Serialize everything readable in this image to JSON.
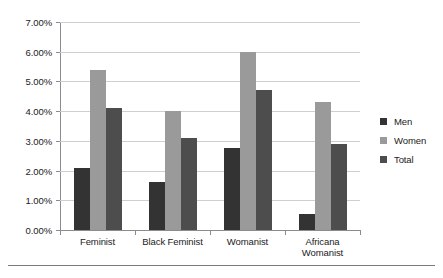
{
  "chart_data": {
    "type": "bar",
    "title": "",
    "xlabel": "",
    "ylabel": "",
    "categories": [
      "Feminist",
      "Black Feminist",
      "Womanist",
      "Africana Womanist"
    ],
    "category_lines": [
      [
        "Feminist"
      ],
      [
        "Black Feminist"
      ],
      [
        "Womanist"
      ],
      [
        "Africana",
        "Womanist"
      ]
    ],
    "series": [
      {
        "name": "Men",
        "color": "#333333",
        "values": [
          2.1,
          1.6,
          2.75,
          0.55
        ]
      },
      {
        "name": "Women",
        "color": "#9a9a9a",
        "values": [
          5.4,
          4.0,
          6.0,
          4.3
        ]
      },
      {
        "name": "Total",
        "color": "#4d4d4d",
        "values": [
          4.1,
          3.1,
          4.7,
          2.9
        ]
      }
    ],
    "ylim": [
      0,
      7
    ],
    "ytick_values": [
      0,
      1,
      2,
      3,
      4,
      5,
      6,
      7
    ],
    "ytick_labels": [
      "0.00%",
      "1.00%",
      "2.00%",
      "3.00%",
      "4.00%",
      "5.00%",
      "6.00%",
      "7.00%"
    ],
    "grid": true,
    "legend_position": "right",
    "legend_entries": [
      "Men",
      "Women",
      "Total"
    ]
  }
}
